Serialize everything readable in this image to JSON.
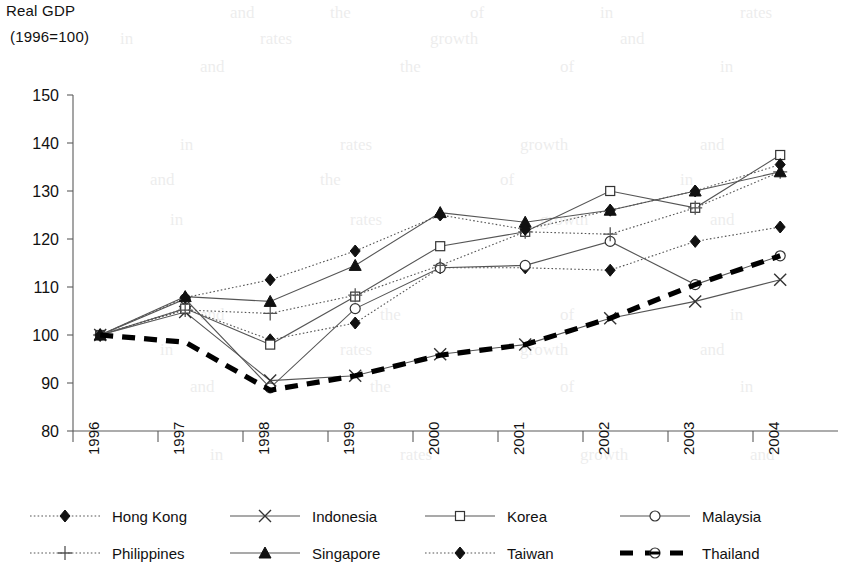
{
  "chart_data": {
    "type": "line",
    "title": "Real GDP",
    "subtitle": "(1996=100)",
    "xlabel": "",
    "ylabel": "",
    "ylim": [
      80,
      150
    ],
    "ytick_step": 10,
    "yticks": [
      80,
      90,
      100,
      110,
      120,
      130,
      140,
      150
    ],
    "grid": false,
    "legend_position": "bottom",
    "categories": [
      "1996",
      "1997",
      "1998",
      "1999",
      "2000",
      "2001",
      "2002",
      "2003",
      "2004"
    ],
    "series": [
      {
        "name": "Hong Kong",
        "marker": "filled-diamond",
        "line": "dotted",
        "values": [
          100,
          105.5,
          99.0,
          102.5,
          114.0,
          114.0,
          113.5,
          119.5,
          122.5
        ]
      },
      {
        "name": "Indonesia",
        "marker": "x-cross",
        "line": "solid",
        "values": [
          100,
          104.8,
          90.5,
          91.5,
          96.0,
          98.0,
          103.5,
          107.0,
          111.5
        ]
      },
      {
        "name": "Korea",
        "marker": "open-square",
        "line": "solid",
        "values": [
          100,
          105.5,
          98.0,
          108.0,
          118.5,
          121.5,
          130.0,
          126.5,
          137.5
        ]
      },
      {
        "name": "Malaysia",
        "marker": "open-circle",
        "line": "solid",
        "values": [
          100,
          107.5,
          89.0,
          105.5,
          114.0,
          114.5,
          119.5,
          110.5,
          116.5
        ]
      },
      {
        "name": "Philippines",
        "marker": "plus-cross",
        "line": "dotted",
        "values": [
          100,
          105.2,
          104.5,
          108.3,
          114.5,
          121.5,
          121.0,
          126.5,
          134.0
        ]
      },
      {
        "name": "Singapore",
        "marker": "filled-triangle",
        "line": "solid",
        "values": [
          100,
          108.0,
          107.0,
          114.5,
          125.5,
          123.5,
          126.0,
          130.0,
          134.0
        ]
      },
      {
        "name": "Taiwan",
        "marker": "filled-diamond",
        "line": "dotted",
        "values": [
          100,
          107.8,
          111.5,
          117.5,
          125.0,
          122.0,
          126.0,
          130.0,
          135.5
        ]
      },
      {
        "name": "Thailand",
        "marker": "none",
        "line": "thick-dashed",
        "values": [
          100,
          98.5,
          88.5,
          91.5,
          95.8,
          98.0,
          103.5,
          110.5,
          116.5
        ]
      }
    ]
  },
  "legend": {
    "entries": [
      {
        "label": "Hong Kong",
        "icon": "filled-diamond-dotted-line-icon"
      },
      {
        "label": "Indonesia",
        "icon": "x-cross-solid-line-icon"
      },
      {
        "label": "Korea",
        "icon": "open-square-solid-line-icon"
      },
      {
        "label": "Malaysia",
        "icon": "open-circle-solid-line-icon"
      },
      {
        "label": "Philippines",
        "icon": "plus-cross-dotted-line-icon"
      },
      {
        "label": "Singapore",
        "icon": "filled-triangle-solid-line-icon"
      },
      {
        "label": "Taiwan",
        "icon": "filled-diamond-dotted-line-icon"
      },
      {
        "label": "Thailand",
        "icon": "thick-dashed-line-icon"
      }
    ]
  },
  "colors": {
    "ink": "#111111",
    "axis": "#5b5b5b",
    "series": "#444444",
    "background": "#ffffff"
  },
  "bleed_text": [
    "and",
    "the",
    "of",
    "in",
    "rates",
    "growth"
  ]
}
